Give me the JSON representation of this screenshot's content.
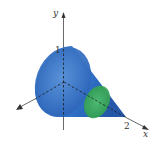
{
  "figure": {
    "type": "3d-solid-cone-diagram",
    "axes": {
      "y": {
        "label": "y",
        "tick_label": "1"
      },
      "x": {
        "label": "x",
        "tick_label": "2"
      },
      "z": {
        "label": ""
      }
    },
    "colors": {
      "cone_body": "#2f6fc4",
      "cone_dark": "#1f4f9e",
      "cone_light": "#5b93d8",
      "cross_section": "#3fae5a",
      "axis": "#333333"
    },
    "annotations": [
      "1",
      "2",
      "x",
      "y"
    ]
  }
}
